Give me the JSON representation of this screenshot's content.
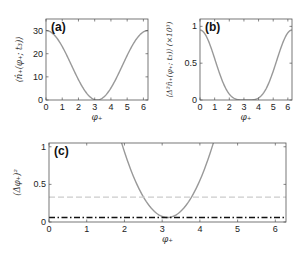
{
  "chart_data": [
    {
      "type": "line",
      "panel": "(a)",
      "title": "",
      "xlabel": "φ+",
      "ylabel": "⟨n̂+(φ+; t3)⟩",
      "xlim": [
        0,
        6.283
      ],
      "ylim": [
        0,
        35
      ],
      "xticks": [
        0,
        1,
        2,
        3,
        4,
        5,
        6
      ],
      "yticks": [
        0,
        10,
        20,
        30
      ],
      "grid": false,
      "series": [
        {
          "name": "mean photon number",
          "color": "#999999",
          "style": "solid",
          "x": [
            0,
            0.5,
            1,
            1.5,
            2,
            2.5,
            3,
            3.14,
            3.5,
            4,
            4.5,
            5,
            5.5,
            6,
            6.28
          ],
          "values": [
            30,
            28.2,
            23.1,
            15.8,
            8.3,
            2.7,
            0.07,
            0,
            0.37,
            3.9,
            10.6,
            17.2,
            24.0,
            28.7,
            30
          ]
        }
      ],
      "frame": {
        "left": 46,
        "top": 19,
        "right": 148,
        "bottom": 100
      }
    },
    {
      "type": "line",
      "panel": "(b)",
      "title": "",
      "xlabel": "φ+",
      "ylabel": "⟨Δ²n̂+(φ+; t3)⟩ (×10³)",
      "xlim": [
        0,
        6.283
      ],
      "ylim": [
        0,
        1.1
      ],
      "xticks": [
        0,
        1,
        2,
        3,
        4,
        5,
        6
      ],
      "yticks": [
        0,
        0.5,
        1
      ],
      "grid": false,
      "series": [
        {
          "name": "photon number variance",
          "color": "#999999",
          "style": "solid",
          "x": [
            0,
            0.5,
            1,
            1.5,
            2,
            2.5,
            3,
            3.14,
            3.5,
            4,
            4.5,
            5,
            5.5,
            6,
            6.28
          ],
          "values": [
            0.95,
            0.84,
            0.6,
            0.29,
            0.08,
            0.01,
            0,
            0,
            0,
            0.02,
            0.14,
            0.38,
            0.68,
            0.88,
            0.95
          ]
        }
      ],
      "frame": {
        "left": 200,
        "top": 19,
        "right": 292,
        "bottom": 100
      }
    },
    {
      "type": "line",
      "panel": "(c)",
      "title": "",
      "xlabel": "φ+",
      "ylabel": "(Δφ+)²",
      "xlim": [
        0,
        6.283
      ],
      "ylim": [
        0,
        1.05
      ],
      "xticks": [
        0,
        1,
        2,
        3,
        4,
        5,
        6
      ],
      "yticks": [
        0,
        0.5,
        1
      ],
      "grid": false,
      "series": [
        {
          "name": "phase sensitivity",
          "color": "#999999",
          "style": "solid",
          "x": [
            1.6,
            1.8,
            2.0,
            2.2,
            2.4,
            2.6,
            2.8,
            3.0,
            3.14,
            3.3,
            3.5,
            3.7,
            3.9,
            4.1,
            4.3,
            4.5,
            4.7
          ],
          "values": [
            1.05,
            0.82,
            0.62,
            0.45,
            0.31,
            0.2,
            0.12,
            0.07,
            0.06,
            0.07,
            0.12,
            0.2,
            0.31,
            0.45,
            0.62,
            0.82,
            1.05
          ]
        },
        {
          "name": "reference (dashed)",
          "color": "#cccccc",
          "style": "dashed",
          "x": [
            0,
            6.283
          ],
          "values": [
            0.33,
            0.33
          ]
        },
        {
          "name": "reference (dash-dot)",
          "color": "#111111",
          "style": "dashdot",
          "x": [
            0,
            6.283
          ],
          "values": [
            0.06,
            0.06
          ]
        }
      ],
      "frame": {
        "left": 49,
        "top": 143,
        "right": 286,
        "bottom": 222
      }
    }
  ],
  "labels": {
    "panel_a": "(a)",
    "panel_b": "(b)",
    "panel_c": "(c)",
    "xlabel": "φ₊",
    "ylabel_a": "⟨n̂₊(φ₊; t₃)⟩",
    "ylabel_b": "⟨Δ²n̂₊(φ₊; t₃)⟩ (×10³)",
    "ylabel_c": "(Δφ₊)²"
  }
}
